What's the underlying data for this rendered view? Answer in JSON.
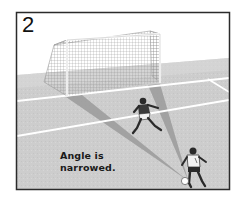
{
  "figure": {
    "panel_number": "2",
    "caption_lines": [
      "Angle is",
      "narrowed."
    ],
    "colors": {
      "frame_border": "#2b2b2b",
      "sky": "#ffffff",
      "field": "#cfcfcf",
      "field_far": "#d8d8d8",
      "field_lines": "#ffffff",
      "angle_shadow": "#9a9a9a",
      "goal_frame": "#ffffff",
      "goal_net": "#8c8c8c",
      "player_dark": "#2a2a2a",
      "player_shirt_white": "#f2f2f2",
      "ball": "#ffffff"
    },
    "elements": [
      {
        "name": "goal",
        "description": "soccer goal with net, upper-left center"
      },
      {
        "name": "defender",
        "description": "player in dark shirt with white shorts, mid-field, lunging"
      },
      {
        "name": "attacker",
        "description": "player in white shirt with dark shorts, bottom-right, dribbling ball"
      },
      {
        "name": "ball",
        "description": "white ball at attacker's feet"
      },
      {
        "name": "angle-wedges",
        "description": "two grey shadow wedges from ball to goal posts"
      }
    ]
  }
}
